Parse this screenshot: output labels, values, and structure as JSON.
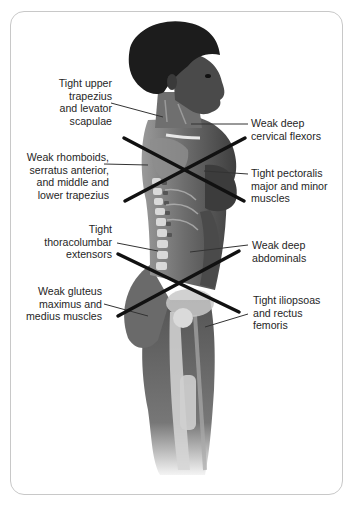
{
  "figure": {
    "type": "anatomical-posture-diagram",
    "colors": {
      "border": "#c8c8c8",
      "text": "#262626",
      "cross_lines": "#111111",
      "leader_lines": "#333333"
    }
  },
  "labels": {
    "upper_trap": {
      "lines": [
        "Tight upper",
        "trapezius",
        "and levator",
        "scapulae"
      ]
    },
    "cervical": {
      "lines": [
        "Weak deep",
        "cervical flexors"
      ]
    },
    "rhomboids": {
      "lines": [
        "Weak rhomboids,",
        "serratus anterior,",
        "and middle and",
        "lower trapezius"
      ]
    },
    "pectoralis": {
      "lines": [
        "Tight pectoralis",
        "major and minor",
        "muscles"
      ]
    },
    "thoracolumbar": {
      "lines": [
        "Tight",
        "thoracolumbar",
        "extensors"
      ]
    },
    "abdominals": {
      "lines": [
        "Weak deep",
        "abdominals"
      ]
    },
    "gluteus": {
      "lines": [
        "Weak gluteus",
        "maximus and",
        "medius muscles"
      ]
    },
    "iliopsoas": {
      "lines": [
        "Tight iliopsoas",
        "and rectus",
        "femoris"
      ]
    }
  },
  "crosses": [
    {
      "name": "upper-crossed-syndrome",
      "center": [
        183,
        170
      ]
    },
    {
      "name": "lower-crossed-syndrome",
      "center": [
        180,
        285
      ]
    }
  ]
}
